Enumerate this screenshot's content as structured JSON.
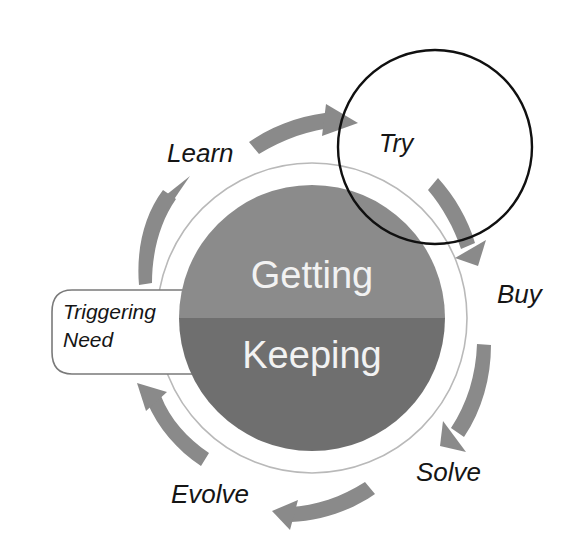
{
  "diagram": {
    "core": {
      "top_half_label": "Getting",
      "bottom_half_label": "Keeping",
      "top_half_color": "#8b8b8b",
      "bottom_half_color": "#6f6f6f",
      "text_color": "#f2f2f2",
      "ring_color": "#b9b9b9"
    },
    "trigger": {
      "line1": "Triggering",
      "line2": "Need",
      "outline_color": "#7a7a7a"
    },
    "overlay": {
      "label": "Try",
      "outline_color": "#101010",
      "fill_color": "#ffffff"
    },
    "stage_labels": [
      {
        "name": "learn",
        "text": "Learn"
      },
      {
        "name": "try",
        "text": "Try"
      },
      {
        "name": "buy",
        "text": "Buy"
      },
      {
        "name": "solve",
        "text": "Solve"
      },
      {
        "name": "evolve",
        "text": "Evolve"
      }
    ],
    "arrows": [
      {
        "name": "arrow-learn-to-try",
        "color": "#8a8a8a"
      },
      {
        "name": "arrow-try-to-buy",
        "color": "#8a8a8a"
      },
      {
        "name": "arrow-buy-to-solve",
        "color": "#8a8a8a"
      },
      {
        "name": "arrow-solve-to-evolve",
        "color": "#8a8a8a"
      },
      {
        "name": "arrow-evolve-to-trigger",
        "color": "#8a8a8a"
      },
      {
        "name": "arrow-trigger-to-learn",
        "color": "#8a8a8a"
      }
    ]
  }
}
